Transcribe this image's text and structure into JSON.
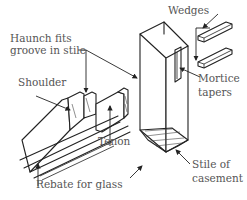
{
  "figure": {
    "labels": {
      "haunch": [
        "Haunch fits",
        "groove in stile"
      ],
      "shoulder": "Shoulder",
      "tenon": "Tenon",
      "rebate": "Rebate for glass",
      "wedges": "Wedges",
      "mortice": [
        "Mortice",
        "tapers"
      ],
      "stile": [
        "Stile of",
        "casement"
      ]
    }
  }
}
